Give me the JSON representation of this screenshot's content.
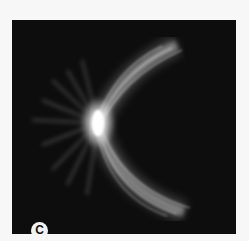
{
  "figure": {
    "panel_label": "C",
    "colors": {
      "background": "#f7f7f7",
      "panel": "#0d0d0d",
      "glow": "#ffffff",
      "badge": "#f2f2f2"
    }
  }
}
